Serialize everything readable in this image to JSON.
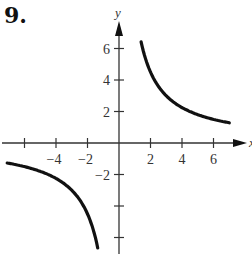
{
  "problem_number": "9.",
  "chart_data": {
    "type": "line",
    "title": "",
    "function": "y = 9/x",
    "xlabel": "x",
    "ylabel": "y",
    "xlim": [
      -7.5,
      7.5
    ],
    "ylim": [
      -7,
      7.5
    ],
    "grid": false,
    "x_ticks": [
      -6,
      -4,
      -2,
      2,
      4,
      6
    ],
    "x_tick_labels": [
      "",
      "-4",
      "-2",
      "2",
      "4",
      "6"
    ],
    "y_ticks": [
      -6,
      -4,
      -2,
      2,
      4,
      6
    ],
    "y_tick_labels": [
      "",
      "",
      "-2",
      "2",
      "4",
      "6"
    ],
    "series": [
      {
        "name": "branch-positive",
        "x": [
          1.4,
          1.6,
          2,
          2.5,
          3,
          4,
          5,
          6,
          7
        ],
        "y": [
          6.43,
          5.63,
          4.5,
          3.6,
          3.0,
          2.25,
          1.8,
          1.5,
          1.29
        ]
      },
      {
        "name": "branch-negative",
        "x": [
          -7.1,
          -6,
          -5,
          -4,
          -3,
          -2.5,
          -2,
          -1.6,
          -1.35
        ],
        "y": [
          -1.27,
          -1.5,
          -1.8,
          -2.25,
          -3.0,
          -3.6,
          -4.5,
          -5.63,
          -6.67
        ]
      }
    ]
  }
}
